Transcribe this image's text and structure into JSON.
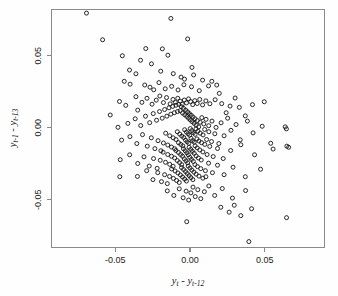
{
  "figure": {
    "background_color": "#fefefe",
    "frame_color": "#8a8a8a",
    "marker_color": "#111111",
    "marker_shape": "open-circle",
    "marker_radius_px": 2.0
  },
  "chart_data": {
    "type": "scatter",
    "title": "",
    "subtitle": "",
    "xlabel": "y_t - y_{t-12}",
    "ylabel": "y_{t-1} - y_{t-13}",
    "xlabel_parts": {
      "var1": "y",
      "sub1": "t",
      "operator": " - ",
      "var2": "y",
      "sub2": "t-12"
    },
    "ylabel_parts": {
      "var1": "y",
      "sub1": "t-1",
      "operator": " - ",
      "var2": "y",
      "sub2": "t-13"
    },
    "xlim": [
      -0.0927,
      0.09
    ],
    "ylim": [
      -0.0831,
      0.082
    ],
    "xticks": [
      -0.05,
      0.0,
      0.05
    ],
    "xtick_labels": [
      "-0.05",
      "0.00",
      "0.05"
    ],
    "yticks": [
      0.05,
      0.0,
      -0.05
    ],
    "ytick_labels": [
      "0.05",
      "0.00",
      "-0.05"
    ],
    "grid": false,
    "legend": null,
    "n_points": 287,
    "correlation": -0.35,
    "points": [
      [
        -0.0693,
        0.0795
      ],
      [
        -0.0128,
        0.0758
      ],
      [
        -0.0585,
        0.061
      ],
      [
        -0.0453,
        0.0499
      ],
      [
        -0.0296,
        0.0549
      ],
      [
        -0.0185,
        0.0547
      ],
      [
        -0.0148,
        0.0503
      ],
      [
        -0.0331,
        0.0468
      ],
      [
        -0.0258,
        0.0443
      ],
      [
        -0.0405,
        0.04
      ],
      [
        -0.0362,
        0.0374
      ],
      [
        -0.0196,
        0.0392
      ],
      [
        -0.0112,
        0.0375
      ],
      [
        -0.006,
        0.0351
      ],
      [
        -0.0037,
        0.0337
      ],
      [
        0.0024,
        0.0366
      ],
      [
        -0.044,
        0.0322
      ],
      [
        -0.0401,
        0.0302
      ],
      [
        -0.0303,
        0.0296
      ],
      [
        -0.0268,
        0.0281
      ],
      [
        -0.0243,
        0.0263
      ],
      [
        -0.0208,
        0.0313
      ],
      [
        -0.0166,
        0.027
      ],
      [
        -0.0123,
        0.0287
      ],
      [
        -0.008,
        0.0262
      ],
      [
        -0.0041,
        0.0298
      ],
      [
        0.001,
        0.0284
      ],
      [
        0.0062,
        0.0257
      ],
      [
        0.0124,
        0.029
      ],
      [
        0.0179,
        0.0296
      ],
      [
        -0.0472,
        0.0182
      ],
      [
        -0.043,
        0.0155
      ],
      [
        -0.0362,
        0.0215
      ],
      [
        -0.0322,
        0.0176
      ],
      [
        -0.0288,
        0.0204
      ],
      [
        -0.0254,
        0.0163
      ],
      [
        -0.0226,
        0.0191
      ],
      [
        -0.0202,
        0.022
      ],
      [
        -0.0178,
        0.0174
      ],
      [
        -0.0157,
        0.0209
      ],
      [
        -0.0133,
        0.0165
      ],
      [
        -0.0114,
        0.0196
      ],
      [
        -0.0098,
        0.0176
      ],
      [
        -0.0082,
        0.0204
      ],
      [
        -0.0066,
        0.0184
      ],
      [
        -0.0052,
        0.0163
      ],
      [
        -0.0038,
        0.0192
      ],
      [
        -0.0024,
        0.0172
      ],
      [
        -0.001,
        0.02
      ],
      [
        0.0004,
        0.0181
      ],
      [
        0.0018,
        0.016
      ],
      [
        0.0032,
        0.0188
      ],
      [
        0.0048,
        0.0168
      ],
      [
        0.0065,
        0.0196
      ],
      [
        0.0084,
        0.0158
      ],
      [
        0.0106,
        0.0186
      ],
      [
        0.0133,
        0.0166
      ],
      [
        0.0168,
        0.0194
      ],
      [
        0.0212,
        0.0167
      ],
      [
        0.0268,
        0.015
      ],
      [
        0.033,
        0.0141
      ],
      [
        0.0418,
        0.016
      ],
      [
        0.0497,
        0.018
      ],
      [
        -0.0482,
        0.0003
      ],
      [
        -0.0416,
        0.003
      ],
      [
        -0.0367,
        0.0062
      ],
      [
        -0.033,
        0.0015
      ],
      [
        -0.0298,
        0.008
      ],
      [
        -0.027,
        0.0035
      ],
      [
        -0.0246,
        0.0098
      ],
      [
        -0.0224,
        0.0052
      ],
      [
        -0.0204,
        0.0112
      ],
      [
        -0.0186,
        0.0066
      ],
      [
        -0.017,
        0.0126
      ],
      [
        -0.0155,
        0.008
      ],
      [
        -0.0141,
        0.0138
      ],
      [
        -0.0128,
        0.0094
      ],
      [
        -0.0116,
        0.0148
      ],
      [
        -0.0105,
        0.0104
      ],
      [
        -0.0094,
        0.0156
      ],
      [
        -0.0084,
        0.0112
      ],
      [
        -0.0075,
        0.0162
      ],
      [
        -0.0066,
        0.0118
      ],
      [
        -0.0058,
        0.0146
      ],
      [
        -0.005,
        0.0102
      ],
      [
        -0.0043,
        0.0134
      ],
      [
        -0.0036,
        0.009
      ],
      [
        -0.0029,
        0.0122
      ],
      [
        -0.0022,
        0.0078
      ],
      [
        -0.0016,
        0.011
      ],
      [
        -0.001,
        0.0066
      ],
      [
        -0.0004,
        0.0098
      ],
      [
        0.0002,
        0.0054
      ],
      [
        0.0008,
        0.0086
      ],
      [
        0.0014,
        0.0042
      ],
      [
        0.002,
        0.0074
      ],
      [
        0.0027,
        0.003
      ],
      [
        0.0034,
        0.0062
      ],
      [
        0.0041,
        0.0018
      ],
      [
        0.0049,
        0.005
      ],
      [
        0.0058,
        0.0006
      ],
      [
        0.0068,
        0.0038
      ],
      [
        0.0079,
        0.007
      ],
      [
        0.0092,
        0.0026
      ],
      [
        0.0107,
        0.0058
      ],
      [
        0.0125,
        0.0014
      ],
      [
        0.0147,
        0.0046
      ],
      [
        0.0174,
        0.0002
      ],
      [
        0.0208,
        0.0034
      ],
      [
        0.0252,
        0.0066
      ],
      [
        0.0308,
        0.0022
      ],
      [
        0.0384,
        0.0046
      ],
      [
        0.0483,
        0.001
      ],
      [
        0.0637,
        0.0006
      ],
      [
        0.0645,
        -0.0008
      ],
      [
        -0.0458,
        -0.0086
      ],
      [
        -0.0402,
        -0.0062
      ],
      [
        -0.0356,
        -0.011
      ],
      [
        -0.0318,
        -0.0048
      ],
      [
        -0.0286,
        -0.0128
      ],
      [
        -0.0259,
        -0.007
      ],
      [
        -0.0235,
        -0.0145
      ],
      [
        -0.0214,
        -0.009
      ],
      [
        -0.0195,
        -0.016
      ],
      [
        -0.0178,
        -0.0106
      ],
      [
        -0.0163,
        -0.0038
      ],
      [
        -0.0149,
        -0.012
      ],
      [
        -0.0136,
        -0.0056
      ],
      [
        -0.0124,
        -0.0134
      ],
      [
        -0.0113,
        -0.007
      ],
      [
        -0.0103,
        -0.0146
      ],
      [
        -0.0094,
        -0.0082
      ],
      [
        -0.0085,
        -0.0028
      ],
      [
        -0.0077,
        -0.0104
      ],
      [
        -0.0069,
        -0.0044
      ],
      [
        -0.0062,
        -0.0116
      ],
      [
        -0.0055,
        -0.0058
      ],
      [
        -0.0048,
        -0.0126
      ],
      [
        -0.0042,
        -0.0068
      ],
      [
        -0.0036,
        -0.0014
      ],
      [
        -0.003,
        -0.0086
      ],
      [
        -0.0024,
        -0.003
      ],
      [
        -0.0019,
        -0.0098
      ],
      [
        -0.0013,
        -0.0042
      ],
      [
        -0.0008,
        -0.0108
      ],
      [
        -0.0003,
        -0.0052
      ],
      [
        0.0002,
        -0.0006
      ],
      [
        0.0007,
        -0.0074
      ],
      [
        0.0012,
        -0.002
      ],
      [
        0.0017,
        -0.009
      ],
      [
        0.0023,
        -0.0034
      ],
      [
        0.0028,
        -0.01
      ],
      [
        0.0034,
        -0.0046
      ],
      [
        0.004,
        -0.0008
      ],
      [
        0.0046,
        -0.0078
      ],
      [
        0.0053,
        -0.0024
      ],
      [
        0.006,
        -0.0092
      ],
      [
        0.0068,
        -0.0038
      ],
      [
        0.0077,
        -0.0104
      ],
      [
        0.0087,
        -0.005
      ],
      [
        0.0098,
        -0.0012
      ],
      [
        0.0111,
        -0.0082
      ],
      [
        0.0126,
        -0.0028
      ],
      [
        0.0144,
        -0.0096
      ],
      [
        0.0166,
        -0.0042
      ],
      [
        0.0193,
        -0.011
      ],
      [
        0.0228,
        -0.0056
      ],
      [
        0.0274,
        -0.0018
      ],
      [
        0.0336,
        -0.0084
      ],
      [
        0.0422,
        -0.0036
      ],
      [
        0.054,
        -0.0108
      ],
      [
        0.0648,
        -0.0128
      ],
      [
        0.066,
        -0.0136
      ],
      [
        -0.0467,
        -0.0222
      ],
      [
        -0.0404,
        -0.0188
      ],
      [
        -0.035,
        -0.0248
      ],
      [
        -0.0308,
        -0.0202
      ],
      [
        -0.0273,
        -0.0266
      ],
      [
        -0.0244,
        -0.0214
      ],
      [
        -0.022,
        -0.0282
      ],
      [
        -0.0199,
        -0.0226
      ],
      [
        -0.018,
        -0.017
      ],
      [
        -0.0164,
        -0.024
      ],
      [
        -0.0149,
        -0.0186
      ],
      [
        -0.0136,
        -0.0254
      ],
      [
        -0.0124,
        -0.0198
      ],
      [
        -0.0113,
        -0.0268
      ],
      [
        -0.0103,
        -0.021
      ],
      [
        -0.0094,
        -0.0158
      ],
      [
        -0.0085,
        -0.0228
      ],
      [
        -0.0077,
        -0.0172
      ],
      [
        -0.007,
        -0.0242
      ],
      [
        -0.0063,
        -0.0186
      ],
      [
        -0.0056,
        -0.0256
      ],
      [
        -0.005,
        -0.0198
      ],
      [
        -0.0044,
        -0.0146
      ],
      [
        -0.0038,
        -0.0216
      ],
      [
        -0.0032,
        -0.016
      ],
      [
        -0.0027,
        -0.023
      ],
      [
        -0.0021,
        -0.0174
      ],
      [
        -0.0016,
        -0.0244
      ],
      [
        -0.0011,
        -0.0188
      ],
      [
        -0.0006,
        -0.0136
      ],
      [
        -0.0001,
        -0.0206
      ],
      [
        0.0005,
        -0.015
      ],
      [
        0.001,
        -0.022
      ],
      [
        0.0016,
        -0.0164
      ],
      [
        0.0022,
        -0.0234
      ],
      [
        0.0028,
        -0.0178
      ],
      [
        0.0034,
        -0.0126
      ],
      [
        0.0041,
        -0.0196
      ],
      [
        0.0048,
        -0.014
      ],
      [
        0.0056,
        -0.021
      ],
      [
        0.0065,
        -0.0154
      ],
      [
        0.0075,
        -0.0224
      ],
      [
        0.0086,
        -0.0168
      ],
      [
        0.0099,
        -0.0116
      ],
      [
        0.0114,
        -0.0186
      ],
      [
        0.0132,
        -0.013
      ],
      [
        0.0155,
        -0.02
      ],
      [
        0.0184,
        -0.0144
      ],
      [
        0.0222,
        -0.0214
      ],
      [
        0.0272,
        -0.0158
      ],
      [
        0.034,
        -0.0118
      ],
      [
        0.0432,
        -0.0188
      ],
      [
        0.0556,
        -0.0148
      ],
      [
        -0.0352,
        -0.0338
      ],
      [
        -0.029,
        -0.0298
      ],
      [
        -0.0248,
        -0.036
      ],
      [
        -0.0216,
        -0.0312
      ],
      [
        -0.0191,
        -0.0374
      ],
      [
        -0.017,
        -0.0326
      ],
      [
        -0.0152,
        -0.0388
      ],
      [
        -0.0137,
        -0.0338
      ],
      [
        -0.0123,
        -0.0286
      ],
      [
        -0.0111,
        -0.0352
      ],
      [
        -0.01,
        -0.03
      ],
      [
        -0.009,
        -0.0366
      ],
      [
        -0.0081,
        -0.0314
      ],
      [
        -0.0072,
        -0.038
      ],
      [
        -0.0064,
        -0.0328
      ],
      [
        -0.0057,
        -0.0276
      ],
      [
        -0.005,
        -0.0342
      ],
      [
        -0.0043,
        -0.029
      ],
      [
        -0.0036,
        -0.0356
      ],
      [
        -0.003,
        -0.0304
      ],
      [
        -0.0024,
        -0.037
      ],
      [
        -0.0018,
        -0.0318
      ],
      [
        -0.0012,
        -0.0266
      ],
      [
        -0.0006,
        -0.0332
      ],
      [
        0.0,
        -0.028
      ],
      [
        0.0006,
        -0.0346
      ],
      [
        0.0012,
        -0.0294
      ],
      [
        0.0019,
        -0.036
      ],
      [
        0.0026,
        -0.0308
      ],
      [
        0.0033,
        -0.0256
      ],
      [
        0.0041,
        -0.0322
      ],
      [
        0.005,
        -0.027
      ],
      [
        0.006,
        -0.0336
      ],
      [
        0.0072,
        -0.0284
      ],
      [
        0.0086,
        -0.035
      ],
      [
        0.0103,
        -0.0298
      ],
      [
        0.0124,
        -0.0246
      ],
      [
        0.015,
        -0.0312
      ],
      [
        0.0184,
        -0.026
      ],
      [
        0.0228,
        -0.0326
      ],
      [
        0.0288,
        -0.0274
      ],
      [
        0.037,
        -0.034
      ],
      [
        0.0472,
        -0.0288
      ],
      [
        -0.0152,
        -0.0438
      ],
      [
        -0.0108,
        -0.047
      ],
      [
        -0.0072,
        -0.0424
      ],
      [
        -0.0046,
        -0.0486
      ],
      [
        -0.0026,
        -0.044
      ],
      [
        -0.0009,
        -0.0502
      ],
      [
        0.0006,
        -0.0452
      ],
      [
        0.002,
        -0.0412
      ],
      [
        0.0035,
        -0.0478
      ],
      [
        0.0052,
        -0.043
      ],
      [
        0.0072,
        -0.0492
      ],
      [
        0.0096,
        -0.0444
      ],
      [
        0.0126,
        -0.0404
      ],
      [
        0.0165,
        -0.047
      ],
      [
        0.0216,
        -0.0422
      ],
      [
        0.0284,
        -0.0488
      ],
      [
        0.0372,
        -0.0436
      ],
      [
        0.0206,
        -0.0552
      ],
      [
        0.0262,
        -0.0586
      ],
      [
        0.0296,
        -0.0538
      ],
      [
        0.034,
        -0.061
      ],
      [
        0.0412,
        -0.0562
      ],
      [
        0.0646,
        -0.0624
      ],
      [
        -0.0022,
        -0.0652
      ],
      [
        0.0394,
        -0.079
      ],
      [
        -0.0534,
        0.0088
      ],
      [
        0.0196,
        0.0238
      ],
      [
        -0.0016,
        0.0616
      ],
      [
        0.0302,
        0.0206
      ],
      [
        0.0146,
        0.0322
      ],
      [
        0.0084,
        0.033
      ],
      [
        -0.035,
        0.0122
      ],
      [
        0.0242,
        0.0104
      ],
      [
        0.037,
        0.0082
      ],
      [
        0.0106,
        -0.034
      ],
      [
        -0.047,
        -0.034
      ],
      [
        0.0013,
        0.0418
      ]
    ]
  }
}
